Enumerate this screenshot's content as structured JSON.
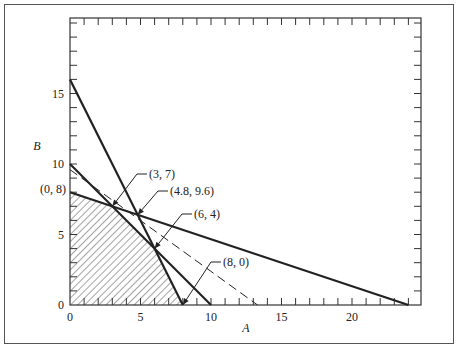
{
  "chart_data": {
    "type": "line",
    "title": "",
    "xlabel": "A",
    "ylabel": "B",
    "xlim": [
      0,
      25
    ],
    "ylim": [
      0,
      20
    ],
    "xticks": [
      0,
      5,
      10,
      15,
      20
    ],
    "yticks": [
      0,
      5,
      10,
      15
    ],
    "grid": false,
    "series": [
      {
        "name": "constraint-1",
        "style": "solid",
        "points": [
          [
            0,
            16
          ],
          [
            8,
            0
          ]
        ]
      },
      {
        "name": "constraint-2",
        "style": "solid",
        "points": [
          [
            0,
            10
          ],
          [
            10,
            0
          ]
        ]
      },
      {
        "name": "constraint-3",
        "style": "solid",
        "points": [
          [
            0,
            8
          ],
          [
            24,
            0
          ]
        ]
      },
      {
        "name": "objective",
        "style": "dashed",
        "points": [
          [
            0,
            9.6
          ],
          [
            13.3,
            0
          ]
        ]
      }
    ],
    "feasible_region": [
      [
        0,
        0
      ],
      [
        0,
        8
      ],
      [
        3,
        7
      ],
      [
        6,
        4
      ],
      [
        8,
        0
      ]
    ],
    "annotations": [
      {
        "text": "(0, 8)",
        "point": [
          0,
          8
        ]
      },
      {
        "text": "(3, 7)",
        "point": [
          3,
          7
        ]
      },
      {
        "text": "(4.8, 9.6)",
        "point": [
          4.8,
          6.4
        ]
      },
      {
        "text": "(6, 4)",
        "point": [
          6,
          4
        ]
      },
      {
        "text": "(8, 0)",
        "point": [
          8,
          0
        ]
      }
    ]
  },
  "labels": {
    "x_axis": "A",
    "y_axis": "B",
    "xtick_labels": [
      "0",
      "5",
      "10",
      "15",
      "20"
    ],
    "ytick_labels": [
      "0",
      "5",
      "10",
      "15"
    ],
    "ann_08": "(0, 8)",
    "ann_37": "(3, 7)",
    "ann_4896": "(4.8, 9.6)",
    "ann_64": "(6, 4)",
    "ann_80": "(8, 0)"
  }
}
